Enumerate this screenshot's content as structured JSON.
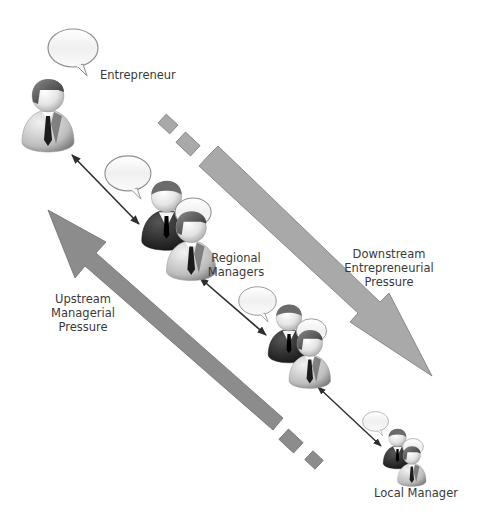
{
  "diagram": {
    "type": "hierarchy-pressure-flow",
    "nodes": [
      {
        "id": "entrepreneur",
        "label": "Entrepreneur",
        "figure": "single-businessman-with-speech-bubble"
      },
      {
        "id": "regional-managers-1",
        "label": "",
        "figure": "two-businessmen-with-speech-bubbles"
      },
      {
        "id": "regional-managers-2",
        "label": "Regional Managers",
        "figure": "two-businessmen-with-speech-bubbles"
      },
      {
        "id": "local-manager",
        "label": "Local Manager",
        "figure": "two-businessmen-small-with-speech-bubbles"
      }
    ],
    "labels": {
      "entrepreneur": "Entrepreneur",
      "regional_line1": "Regional",
      "regional_line2": "Managers",
      "local": "Local Manager",
      "downstream_line1": "Downstream",
      "downstream_line2": "Entrepreneurial",
      "downstream_line3": "Pressure",
      "upstream_line1": "Upstream",
      "upstream_line2": "Managerial",
      "upstream_line3": "Pressure"
    },
    "edges": [
      {
        "from": "entrepreneur",
        "to": "regional-managers-1",
        "style": "double-headed-arrow"
      },
      {
        "from": "regional-managers-1",
        "to": "regional-managers-2",
        "style": "double-headed-arrow"
      },
      {
        "from": "regional-managers-2",
        "to": "local-manager",
        "style": "double-headed-arrow"
      }
    ],
    "flows": [
      {
        "name": "Downstream Entrepreneurial Pressure",
        "direction": "top-left to bottom-right"
      },
      {
        "name": "Upstream Managerial Pressure",
        "direction": "bottom-right to top-left"
      }
    ],
    "colors": {
      "arrow_fill": "#a9a9a9",
      "arrow_fill_dark": "#8c8c8c",
      "arrow_stroke": "#7a7a7a",
      "text": "#3a3a3a",
      "suit_dark": "#1e1e1e",
      "background": "#ffffff"
    }
  }
}
